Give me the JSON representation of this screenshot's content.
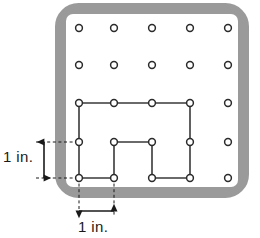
{
  "figure": {
    "name": "geoboard-polygon-figure",
    "board": {
      "frame_color": "#9a9a9a",
      "face_color": "#ffffff",
      "border_width": 11,
      "corner_radius": 18,
      "outer": {
        "x": 55,
        "y": 3,
        "width": 194,
        "height": 195
      }
    },
    "grid": {
      "columns": 5,
      "rows": 5,
      "column_x": [
        79,
        114,
        152,
        190,
        228
      ],
      "row_y": [
        28,
        65,
        103,
        142,
        178
      ],
      "peg_radius": 3.4,
      "peg_stroke": "#2b2b2b",
      "peg_fill": "#ffffff"
    },
    "shape": {
      "stroke": "#3a3a3a",
      "stroke_width": 1.6,
      "fill": "none",
      "vertices_rc": [
        [
          2,
          0
        ],
        [
          2,
          1
        ],
        [
          2,
          2
        ],
        [
          2,
          3
        ],
        [
          3,
          3
        ],
        [
          4,
          3
        ],
        [
          4,
          2
        ],
        [
          3,
          2
        ],
        [
          3,
          1
        ],
        [
          4,
          1
        ],
        [
          4,
          0
        ],
        [
          3,
          0
        ]
      ],
      "path_points": [
        [
          79,
          103
        ],
        [
          114,
          103
        ],
        [
          152,
          103
        ],
        [
          190,
          103
        ],
        [
          190,
          142
        ],
        [
          190,
          178
        ],
        [
          152,
          178
        ],
        [
          152,
          142
        ],
        [
          114,
          142
        ],
        [
          114,
          178
        ],
        [
          79,
          178
        ],
        [
          79,
          142
        ]
      ]
    },
    "dimensions": [
      {
        "id": "vertical-dimension",
        "label": "1 in.",
        "orientation": "vertical",
        "from_row": 3,
        "to_row": 4,
        "arrow_x": 44,
        "arrow_y_top": 142,
        "arrow_y_bottom": 178,
        "extension_from_x": 79,
        "line_color": "#1a1a1a"
      },
      {
        "id": "horizontal-dimension",
        "label": "1 in.",
        "orientation": "horizontal",
        "from_column": 0,
        "to_column": 1,
        "arrow_y": 211,
        "arrow_x_left": 79,
        "arrow_x_right": 114,
        "extension_from_y": 178,
        "line_color": "#1a1a1a"
      }
    ]
  }
}
